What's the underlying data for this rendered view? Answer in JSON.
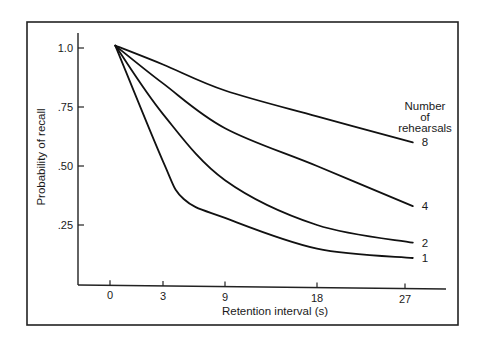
{
  "chart_data": {
    "type": "line",
    "title": "",
    "xlabel": "Retention interval (s)",
    "ylabel": "Probability of recall",
    "x_ticks": [
      0,
      3,
      9,
      18,
      27
    ],
    "x_tick_labels": [
      "0",
      "3",
      "9",
      "18",
      "27"
    ],
    "y_ticks": [
      1.0,
      0.75,
      0.5,
      0.25
    ],
    "y_tick_labels": [
      "1.0",
      ".75",
      ".50",
      ".25"
    ],
    "ylim": [
      0,
      1.05
    ],
    "grid": false,
    "legend": {
      "title_lines": [
        "Number",
        "of",
        "rehearsals"
      ],
      "position": "right, inline labels at curve ends"
    },
    "series": [
      {
        "name": "8",
        "label": "8",
        "points": [
          [
            0.3,
            1.01
          ],
          [
            3,
            0.93
          ],
          [
            9,
            0.82
          ],
          [
            18,
            0.71
          ],
          [
            27.8,
            0.6
          ]
        ]
      },
      {
        "name": "4",
        "label": "4",
        "points": [
          [
            0.3,
            1.01
          ],
          [
            3,
            0.85
          ],
          [
            9,
            0.66
          ],
          [
            18,
            0.5
          ],
          [
            27.8,
            0.33
          ]
        ]
      },
      {
        "name": "2",
        "label": "2",
        "points": [
          [
            0.3,
            1.01
          ],
          [
            3,
            0.72
          ],
          [
            9,
            0.44
          ],
          [
            18,
            0.25
          ],
          [
            27.8,
            0.175
          ]
        ]
      },
      {
        "name": "1",
        "label": "1",
        "points": [
          [
            0.3,
            1.01
          ],
          [
            3,
            0.52
          ],
          [
            5,
            0.36
          ],
          [
            9,
            0.28
          ],
          [
            18,
            0.15
          ],
          [
            27.8,
            0.11
          ]
        ]
      }
    ]
  }
}
